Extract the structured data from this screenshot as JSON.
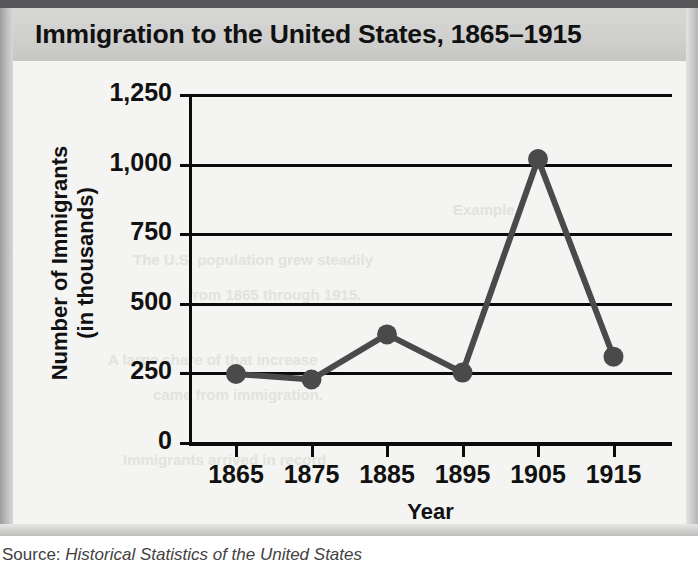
{
  "figure": {
    "title": "Immigration to the United States, 1865–1915",
    "source_prefix": "Source: ",
    "source_title": "Historical Statistics of the United States"
  },
  "colors": {
    "line": "#4a4a4a",
    "marker": "#4a4a4a",
    "axis": "#0b0b0b",
    "title_band": "#cfcfcd",
    "canvas": "#f4f4f2",
    "top_bar": "#58585a"
  },
  "ghost_text": [
    {
      "text": "Example",
      "x": 440,
      "y": 140
    },
    {
      "text": "The U.S. population grew steadily",
      "x": 120,
      "y": 190
    },
    {
      "text": "from 1865 through 1915.",
      "x": 175,
      "y": 225
    },
    {
      "text": "A large share of that increase",
      "x": 95,
      "y": 290
    },
    {
      "text": "came from immigration.",
      "x": 140,
      "y": 325
    },
    {
      "text": "Immigrants arrived in record",
      "x": 110,
      "y": 390
    }
  ],
  "chart_data": {
    "type": "line",
    "title": "Immigration to the United States, 1865–1915",
    "xlabel": "Year",
    "ylabel": "Number of Immigrants (in thousands)",
    "ylabel_lines": [
      "Number of Immigrants",
      "(in thousands)"
    ],
    "categories": [
      "1865",
      "1875",
      "1885",
      "1895",
      "1905",
      "1915"
    ],
    "x": [
      1865,
      1875,
      1885,
      1895,
      1905,
      1915
    ],
    "values": [
      248,
      228,
      390,
      253,
      1020,
      310
    ],
    "series": [
      {
        "name": "Number of Immigrants (in thousands)",
        "values": [
          248,
          228,
          390,
          253,
          1020,
          310
        ]
      }
    ],
    "ylim": [
      0,
      1250
    ],
    "yticks": [
      0,
      250,
      500,
      750,
      1000,
      1250
    ],
    "ytick_labels": [
      "0",
      "250",
      "500",
      "750",
      "1,000",
      "1,250"
    ],
    "xtick_labels": [
      "1865",
      "1875",
      "1885",
      "1895",
      "1905",
      "1915"
    ],
    "grid": "horizontal",
    "legend": "none",
    "marker": "circle",
    "units": "thousands"
  }
}
